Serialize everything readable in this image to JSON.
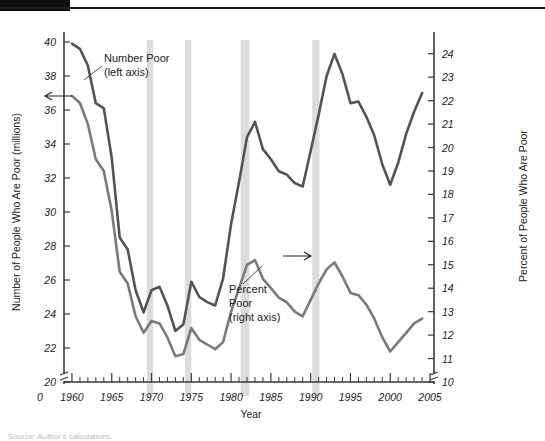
{
  "figure": {
    "bottom_clipped_text": "Source: Author's calculations."
  },
  "chart_data": {
    "type": "line",
    "title": "",
    "xlabel": "Year",
    "ylabel": "Number of People Who Are Poor (millions)",
    "y2label": "Percent of People Who Are Poor",
    "xlim": [
      1959,
      2005.5
    ],
    "ylim": [
      20,
      40
    ],
    "y2lim": [
      10,
      24.5
    ],
    "xticks": [
      1960,
      1965,
      1970,
      1975,
      1980,
      1985,
      1990,
      1995,
      2000,
      2005
    ],
    "xticklabels": [
      "1960",
      "1965",
      "1970",
      "1975",
      "1980",
      "1985",
      "1990",
      "1995",
      "2000",
      "2005"
    ],
    "x_origin_label": "0",
    "yticks": [
      20,
      22,
      24,
      26,
      28,
      30,
      32,
      34,
      36,
      38,
      40
    ],
    "yticklabels": [
      "20",
      "22",
      "24",
      "26",
      "28",
      "30",
      "32",
      "34",
      "36",
      "38",
      "40"
    ],
    "y2ticks": [
      10,
      11,
      12,
      13,
      14,
      15,
      16,
      17,
      18,
      19,
      20,
      21,
      22,
      23,
      24
    ],
    "y2ticklabels": [
      "10",
      "11",
      "12",
      "13",
      "14",
      "15",
      "16",
      "17",
      "18",
      "19",
      "20",
      "21",
      "22",
      "23",
      "24"
    ],
    "axis_break": true,
    "grid": false,
    "legend": "annotations",
    "minor_xticks_step": 1,
    "annotations": [
      {
        "name": "number-poor",
        "text": "Number Poor\n(left axis)",
        "lines": [
          "Number Poor",
          "(left axis)"
        ],
        "arrow_direction": "left",
        "axis": "left"
      },
      {
        "name": "percent-poor",
        "text": "Percent Poor\n(right axis)",
        "lines": [
          "Percent",
          "Poor",
          "(right axis)"
        ],
        "arrow_direction": "right",
        "axis": "right"
      }
    ],
    "recession_bands": [
      {
        "start": 1969.4,
        "end": 1970.2
      },
      {
        "start": 1974.2,
        "end": 1975.0
      },
      {
        "start": 1981.2,
        "end": 1982.3
      },
      {
        "start": 1990.2,
        "end": 1991.1
      }
    ],
    "band_color": "#dcdcdc",
    "series": [
      {
        "name": "Number Poor (millions)",
        "axis": "left",
        "color": "#545454",
        "x": [
          1960,
          1961,
          1962,
          1963,
          1964,
          1965,
          1966,
          1967,
          1968,
          1969,
          1970,
          1971,
          1972,
          1973,
          1974,
          1975,
          1976,
          1977,
          1978,
          1979,
          1980,
          1981,
          1982,
          1983,
          1984,
          1985,
          1986,
          1987,
          1988,
          1989,
          1990,
          1991,
          1992,
          1993,
          1994,
          1995,
          1996,
          1997,
          1998,
          1999,
          2000,
          2001,
          2002,
          2003,
          2004
        ],
        "values": [
          39.9,
          39.6,
          38.6,
          36.4,
          36.1,
          33.2,
          28.5,
          27.8,
          25.4,
          24.1,
          25.4,
          25.6,
          24.5,
          23.0,
          23.4,
          25.9,
          25.0,
          24.7,
          24.5,
          26.1,
          29.3,
          31.8,
          34.4,
          35.3,
          33.7,
          33.1,
          32.4,
          32.2,
          31.7,
          31.5,
          33.6,
          35.7,
          38.0,
          39.3,
          38.1,
          36.4,
          36.5,
          35.6,
          34.5,
          32.8,
          31.6,
          32.9,
          34.6,
          35.9,
          37.0
        ]
      },
      {
        "name": "Percent Poor (percent)",
        "axis": "right",
        "color": "#7a7a7a",
        "x": [
          1960,
          1961,
          1962,
          1963,
          1964,
          1965,
          1966,
          1967,
          1968,
          1969,
          1970,
          1971,
          1972,
          1973,
          1974,
          1975,
          1976,
          1977,
          1978,
          1979,
          1980,
          1981,
          1982,
          1983,
          1984,
          1985,
          1986,
          1987,
          1988,
          1989,
          1990,
          1991,
          1992,
          1993,
          1994,
          1995,
          1996,
          1997,
          1998,
          1999,
          2000,
          2001,
          2002,
          2003,
          2004
        ],
        "values": [
          22.2,
          21.9,
          21.0,
          19.5,
          19.0,
          17.3,
          14.7,
          14.2,
          12.8,
          12.1,
          12.6,
          12.5,
          11.9,
          11.1,
          11.2,
          12.3,
          11.8,
          11.6,
          11.4,
          11.7,
          13.0,
          14.0,
          15.0,
          15.2,
          14.4,
          14.0,
          13.6,
          13.4,
          13.0,
          12.8,
          13.5,
          14.2,
          14.8,
          15.1,
          14.5,
          13.8,
          13.7,
          13.3,
          12.7,
          11.9,
          11.3,
          11.7,
          12.1,
          12.5,
          12.7
        ]
      }
    ]
  }
}
